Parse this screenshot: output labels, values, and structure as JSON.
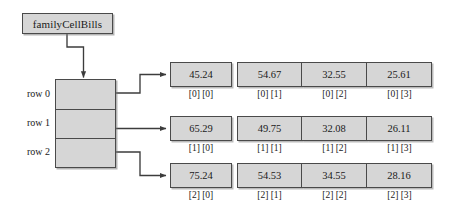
{
  "diagram": {
    "variable": {
      "name": "familyCellBills"
    },
    "reference_box": {
      "row_labels": [
        "row 0",
        "row 1",
        "row 2"
      ]
    },
    "rows": [
      {
        "label": "row 0",
        "cells": [
          {
            "value": "45.24",
            "index": "[0] [0]"
          },
          {
            "value": "54.67",
            "index": "[0] [1]"
          },
          {
            "value": "32.55",
            "index": "[0] [2]"
          },
          {
            "value": "25.61",
            "index": "[0] [3]"
          }
        ]
      },
      {
        "label": "row 1",
        "cells": [
          {
            "value": "65.29",
            "index": "[1] [0]"
          },
          {
            "value": "49.75",
            "index": "[1] [1]"
          },
          {
            "value": "32.08",
            "index": "[1] [2]"
          },
          {
            "value": "26.11",
            "index": "[1] [3]"
          }
        ]
      },
      {
        "label": "row 2",
        "cells": [
          {
            "value": "75.24",
            "index": "[2] [0]"
          },
          {
            "value": "54.53",
            "index": "[2] [1]"
          },
          {
            "value": "34.55",
            "index": "[2] [2]"
          },
          {
            "value": "28.16",
            "index": "[2] [3]"
          }
        ]
      }
    ],
    "colors": {
      "cell_fill": "#d6d6d6",
      "stroke": "#4a4a4a",
      "text": "#1a1a1a",
      "background": "#ffffff"
    }
  }
}
